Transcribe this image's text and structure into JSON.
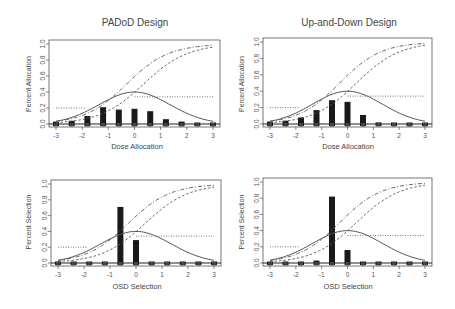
{
  "chart_data": [
    {
      "type": "bar",
      "title": "PADoD Design",
      "xlabel": "Dose Allocation",
      "ylabel": "Percent Allocation",
      "xlim": [
        -3,
        3
      ],
      "ylim": [
        0,
        1.0
      ],
      "xticks": [
        -3,
        -2,
        -1,
        0,
        1,
        2,
        3
      ],
      "yticks": [
        0.0,
        0.2,
        0.4,
        0.6,
        0.8,
        1.0
      ],
      "x": [
        -3.0,
        -2.4,
        -1.8,
        -1.2,
        -0.6,
        0.0,
        0.6,
        1.2,
        1.8,
        2.4,
        3.0
      ],
      "values": [
        0.03,
        0.04,
        0.1,
        0.21,
        0.18,
        0.19,
        0.16,
        0.06,
        0.03,
        0.01,
        0.01
      ],
      "grid": false
    },
    {
      "type": "bar",
      "title": "Up-and-Down Design",
      "xlabel": "Dose Allocation",
      "ylabel": "Percent Allocation",
      "xlim": [
        -3,
        3
      ],
      "ylim": [
        0,
        1.0
      ],
      "xticks": [
        -3,
        -2,
        -1,
        0,
        1,
        2,
        3
      ],
      "yticks": [
        0.0,
        0.2,
        0.4,
        0.6,
        0.8,
        1.0
      ],
      "x": [
        -3.0,
        -2.4,
        -1.8,
        -1.2,
        -0.6,
        0.0,
        0.6,
        1.2,
        1.8,
        2.4,
        3.0
      ],
      "values": [
        0.03,
        0.04,
        0.08,
        0.17,
        0.29,
        0.27,
        0.11,
        0.02,
        0.005,
        0.005,
        0.005
      ],
      "grid": false
    },
    {
      "type": "bar",
      "title": "",
      "xlabel": "OSD Selection",
      "ylabel": "Percent Selection",
      "xlim": [
        -3,
        3
      ],
      "ylim": [
        0,
        1.0
      ],
      "xticks": [
        -3,
        -2,
        -1,
        0,
        1,
        2,
        3
      ],
      "yticks": [
        0.0,
        0.2,
        0.4,
        0.6,
        0.8,
        1.0
      ],
      "x": [
        -3.0,
        -2.4,
        -1.8,
        -1.2,
        -0.6,
        0.0,
        0.6,
        1.2,
        1.8,
        2.4,
        3.0
      ],
      "values": [
        0.005,
        0.005,
        0.005,
        0.005,
        0.71,
        0.29,
        0.005,
        0.005,
        0.005,
        0.005,
        0.005
      ],
      "grid": false
    },
    {
      "type": "bar",
      "title": "",
      "xlabel": "OSD Selection",
      "ylabel": "Percent Selection",
      "xlim": [
        -3,
        3
      ],
      "ylim": [
        0,
        1.0
      ],
      "xticks": [
        -3,
        -2,
        -1,
        0,
        1,
        2,
        3
      ],
      "yticks": [
        0.0,
        0.2,
        0.4,
        0.6,
        0.8,
        1.0
      ],
      "x": [
        -3.0,
        -2.4,
        -1.8,
        -1.2,
        -0.6,
        0.0,
        0.6,
        1.2,
        1.8,
        2.4,
        3.0
      ],
      "values": [
        0.005,
        0.005,
        0.005,
        0.03,
        0.82,
        0.16,
        0.005,
        0.005,
        0.005,
        0.005,
        0.005
      ],
      "grid": false
    }
  ],
  "overlay_curves": {
    "description": "Same reference curves overlaid on all four panels",
    "solid_bell": "peak ~0.40 at x=0, ~0.08 at x=-3 and x=3",
    "dash_dot_sigmoid": "~0.08 at x=-3 rising to ~0.98 at x=3, ~0.62 at x=0",
    "dashed_sigmoid": "~0.02 at x=-3 rising to ~0.95 at x=3, ~0.37 at x=0",
    "dotted_step": "0.20 for x<-1.8, 0.34 for x>0"
  },
  "panels": [
    {
      "title": "PADoD Design",
      "xlabel": "Dose Allocation",
      "ylabel": "Percent Allocation"
    },
    {
      "title": "Up-and-Down Design",
      "xlabel": "Dose Allocation",
      "ylabel": "Percent Allocation"
    },
    {
      "title": "",
      "xlabel": "OSD Selection",
      "ylabel": "Percent Selection"
    },
    {
      "title": "",
      "xlabel": "OSD Selection",
      "ylabel": "Percent Selection"
    }
  ]
}
